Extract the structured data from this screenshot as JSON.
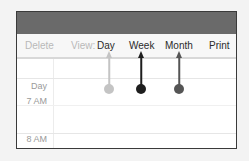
{
  "toolbar": {
    "items": [
      {
        "label": "Delete",
        "enabled": false
      },
      {
        "label": "View:",
        "enabled": false
      },
      {
        "label": "Day",
        "enabled": true
      },
      {
        "label": "Week",
        "enabled": true
      },
      {
        "label": "Month",
        "enabled": true
      },
      {
        "label": "Print",
        "enabled": true
      }
    ]
  },
  "calendar": {
    "header_label": "Day",
    "time_slots": [
      "7 AM",
      "8 AM"
    ]
  },
  "callouts": [
    {
      "target": "Day",
      "color": "#c4c4c4"
    },
    {
      "target": "Week",
      "color": "#1e1e1e"
    },
    {
      "target": "Month",
      "color": "#555555"
    }
  ]
}
